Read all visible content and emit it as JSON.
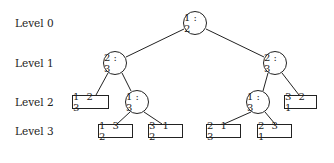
{
  "levels": [
    "Level  0",
    "Level  1",
    "Level  2",
    "Level  3"
  ],
  "nodes": {
    "root": "1 : 2",
    "l1_left": "2 : 3",
    "l1_right": "2 : 3",
    "l2_left_leaf": "1 2 3",
    "l2_left_cmp": "1 : 3",
    "l2_right_cmp": "1 : 3",
    "l2_right_leaf": "3 2 1",
    "l3_a": "1 3 2",
    "l3_b": "3 1 2",
    "l3_c": "2 1 3",
    "l3_d": "2 3 1"
  },
  "colors": {
    "stroke": "#222222",
    "background": "#ffffff"
  }
}
